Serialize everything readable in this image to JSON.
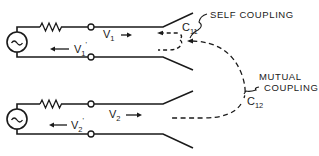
{
  "diagram": {
    "type": "coupled transmission line schematic",
    "stroke_color": "#1a1a1a",
    "background": "#ffffff",
    "line1": {
      "source_icon": "ac-source-icon",
      "resistor_icon": "resistor-icon",
      "forward_wave": {
        "symbol": "V",
        "subscript": "1",
        "prime": ""
      },
      "reflected_wave": {
        "symbol": "V",
        "subscript": "1",
        "prime": "'"
      }
    },
    "line2": {
      "source_icon": "ac-source-icon",
      "resistor_icon": "resistor-icon",
      "forward_wave": {
        "symbol": "V",
        "subscript": "2",
        "prime": ""
      },
      "reflected_wave": {
        "symbol": "V",
        "subscript": "2",
        "prime": "'"
      }
    },
    "self_coupling": {
      "label": "SELF COUPLING",
      "capacitance": {
        "symbol": "C",
        "subscript": "11"
      }
    },
    "mutual_coupling": {
      "label_line1": "MUTUAL",
      "label_line2": "COUPLING",
      "capacitance": {
        "symbol": "C",
        "subscript": "12"
      }
    }
  }
}
